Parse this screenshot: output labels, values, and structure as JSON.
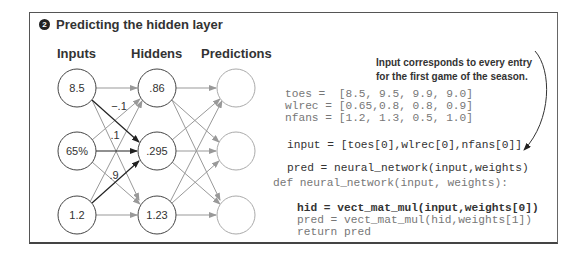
{
  "title": {
    "badge": "2",
    "text": "Predicting the hidden layer"
  },
  "columns": {
    "inputs": "Inputs",
    "hiddens": "Hiddens",
    "predictions": "Predictions"
  },
  "inputs": [
    "8.5",
    "65%",
    "1.2"
  ],
  "hiddens": [
    ".86",
    ".295",
    "1.23"
  ],
  "predictions": [
    "",
    "",
    ""
  ],
  "weights_labels": [
    "−.1",
    ".1",
    ".9"
  ],
  "annotation": {
    "line1": "Input corresponds to every entry",
    "line2": "for the first game of the season."
  },
  "code": {
    "toes": "toes =  [8.5, 9.5, 9.9, 9.0]",
    "wlrec": "wlrec = [0.65,0.8, 0.8, 0.9]",
    "nfans": "nfans = [1.2, 1.3, 0.5, 1.0]",
    "input": "input = [toes[0],wlrec[0],nfans[0]]",
    "pred_call": "pred = neural_network(input,weights)",
    "def": "def neural_network(input, weights):",
    "hid": "hid = vect_mat_mul(input,weights[0])",
    "pred_inner": "pred = vect_mat_mul(hid,weights[1])",
    "return": "return pred"
  }
}
